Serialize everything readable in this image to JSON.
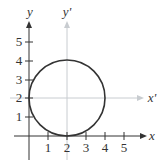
{
  "diagram": {
    "axes": {
      "x_label": "x",
      "y_label": "y",
      "x_prime_label": "x'",
      "y_prime_label": "y'"
    },
    "x_ticks": [
      "1",
      "2",
      "3",
      "4",
      "5"
    ],
    "y_ticks": [
      "1",
      "2",
      "3",
      "4",
      "5"
    ],
    "circle": {
      "center_x": 2,
      "center_y": 2,
      "radius": 2
    },
    "colors": {
      "axis": "#333333",
      "translated_axis": "#bfc3c7",
      "circle": "#333333"
    }
  }
}
